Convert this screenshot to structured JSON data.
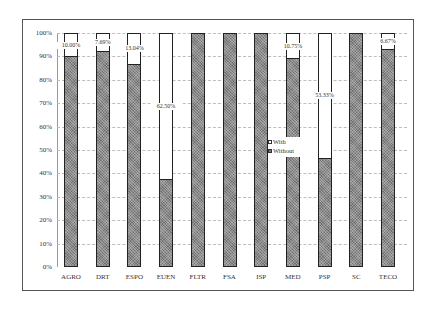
{
  "chart_data": {
    "type": "bar",
    "stacked": true,
    "percent_stacked": true,
    "title": "",
    "xlabel": "",
    "ylabel": "",
    "ylim": [
      0,
      100
    ],
    "y_ticks": [
      "0%",
      "10%",
      "20%",
      "30%",
      "40%",
      "50%",
      "60%",
      "70%",
      "80%",
      "90%",
      "100%"
    ],
    "grid": true,
    "legend_position": "inside-center",
    "categories": [
      "AGRO",
      "DRT",
      "ESPO",
      "EUEN",
      "FLTR",
      "FSA",
      "ISP",
      "MED",
      "PSP",
      "SC",
      "TECO"
    ],
    "series": [
      {
        "name": "With",
        "values": [
          10.0,
          7.69,
          13.04,
          62.5,
          0,
          0,
          0,
          10.75,
          53.33,
          0,
          6.67
        ],
        "color": "#ffffff"
      },
      {
        "name": "Without",
        "values": [
          90.0,
          92.31,
          86.96,
          37.5,
          100,
          100,
          100,
          89.25,
          46.67,
          100,
          93.33
        ],
        "color": "#8a8a8a"
      }
    ],
    "data_labels": [
      "10.00%",
      "7.69%",
      "13.04%",
      "62.50%",
      "",
      "",
      "",
      "10.75%",
      "53.33%",
      "",
      "6.67%"
    ]
  },
  "legend": {
    "with": "With",
    "without": "Without"
  }
}
